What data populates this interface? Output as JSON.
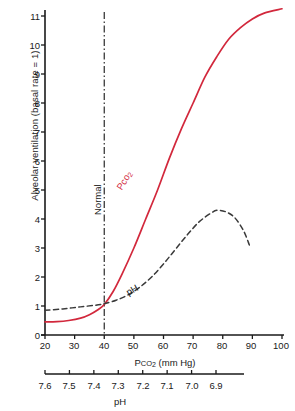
{
  "chart_data": {
    "type": "line",
    "title": "",
    "xlabel": "Pco2 (mm Hg)",
    "xlabel_main": "P",
    "xlabel_sub": "CO",
    "xlabel_sub2": "2",
    "xlabel_units": " (mm Hg)",
    "ylabel": "Alveolar ventilation (basal rate = 1)",
    "secondary_xlabel": "pH",
    "xlim": [
      20,
      100
    ],
    "ylim": [
      0,
      11
    ],
    "xticks": [
      "20",
      "30",
      "40",
      "50",
      "60",
      "70",
      "80",
      "90",
      "100"
    ],
    "xtick_values": [
      20,
      30,
      40,
      50,
      60,
      70,
      80,
      90,
      100
    ],
    "yticks": [
      "0",
      "1",
      "2",
      "3",
      "4",
      "5",
      "6",
      "7",
      "8",
      "9",
      "10",
      "11"
    ],
    "ytick_values": [
      0,
      1,
      2,
      3,
      4,
      5,
      6,
      7,
      8,
      9,
      10,
      11
    ],
    "ph_ticks": [
      "7.6",
      "7.5",
      "7.4",
      "7.3",
      "7.2",
      "7.1",
      "7.0",
      "6.9"
    ],
    "ph_tick_values": [
      7.6,
      7.5,
      7.4,
      7.3,
      7.2,
      7.1,
      7.0,
      6.9
    ],
    "ph_axis_range": [
      7.6,
      6.9
    ],
    "grid": false,
    "legend": "none",
    "annotations": [
      {
        "text": "Normal",
        "x": 40,
        "style": "vertical-dash-dot-line"
      },
      {
        "text": "PCO2",
        "style": "red-solid-curve-label"
      },
      {
        "text": "pH",
        "style": "black-dashed-curve-label"
      }
    ],
    "series": [
      {
        "name": "PCO2",
        "color": "#d2283c",
        "style": "solid",
        "x": [
          20,
          24,
          28,
          32,
          35,
          38,
          40,
          43,
          46,
          50,
          54,
          58,
          62,
          66,
          70,
          74,
          78,
          82,
          86,
          90,
          94,
          100
        ],
        "values": [
          0.45,
          0.46,
          0.5,
          0.58,
          0.7,
          0.88,
          1.05,
          1.5,
          2.1,
          3.0,
          4.0,
          5.0,
          6.1,
          7.1,
          8.0,
          8.9,
          9.6,
          10.2,
          10.6,
          10.9,
          11.1,
          11.25
        ]
      },
      {
        "name": "pH",
        "color": "#3a3a3a",
        "style": "dashed",
        "x": [
          20,
          26,
          32,
          38,
          40,
          44,
          48,
          52,
          56,
          60,
          64,
          68,
          72,
          76,
          78,
          81,
          84,
          87,
          89
        ],
        "values": [
          0.85,
          0.9,
          0.97,
          1.04,
          1.08,
          1.2,
          1.38,
          1.65,
          2.0,
          2.45,
          2.95,
          3.45,
          3.9,
          4.2,
          4.3,
          4.25,
          4.05,
          3.6,
          3.1
        ]
      }
    ]
  },
  "axes": {
    "y_axis_title": "Alveolar ventilation (basal rate = 1)",
    "x_axis_title_units": "(mm Hg)",
    "ph_axis_title": "pH"
  },
  "labels": {
    "normal": "Normal",
    "pco2_curve": "Pco",
    "pco2_curve_sub": "2",
    "ph_curve": "pH"
  },
  "colors": {
    "red_curve": "#d2283c",
    "dashed_curve": "#3a3a3a",
    "axis": "#1a1a1a"
  }
}
